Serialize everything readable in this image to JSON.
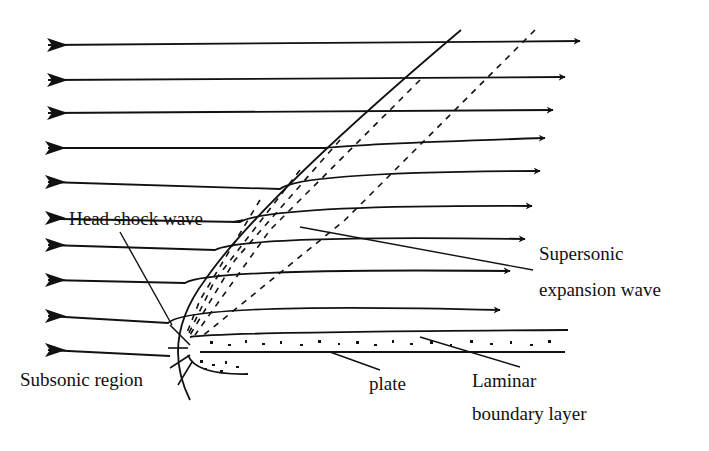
{
  "diagram": {
    "labels": {
      "head_shock": "Head shock wave",
      "expansion_1": "Supersonic",
      "expansion_2": "expansion wave",
      "subsonic": "Subsonic region",
      "plate": "plate",
      "laminar_1": "Laminar",
      "laminar_2": "boundary layer"
    },
    "streamline_count": 10,
    "colors": {
      "line": "#111111",
      "background": "#ffffff"
    }
  }
}
